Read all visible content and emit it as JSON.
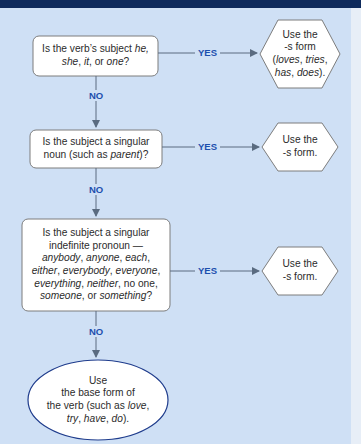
{
  "diagram": {
    "type": "flowchart",
    "colors": {
      "header_bar": "#0e2a5c",
      "background": "#cfe0f5",
      "box_fill": "#ffffff",
      "box_border": "#7a7a7a",
      "ellipse_border": "#1f3c8c",
      "connector": "#5a6b80",
      "label_text": "#1d4fae"
    },
    "decisions": [
      {
        "id": "q1",
        "lines": [
          "Is the verb's subject he,",
          "she, it, or one?"
        ],
        "italic_terms": [
          "he",
          "she",
          "it",
          "one"
        ],
        "yes_label": "YES",
        "no_label": "NO"
      },
      {
        "id": "q2",
        "lines": [
          "Is the subject a singular",
          "noun (such as parent)?"
        ],
        "italic_terms": [
          "parent"
        ],
        "yes_label": "YES",
        "no_label": "NO"
      },
      {
        "id": "q3",
        "lines": [
          "Is the subject a singular",
          "indefinite pronoun —",
          "anybody, anyone, each,",
          "either, everybody, everyone,",
          "everything, neither, no one,",
          "someone, or something?"
        ],
        "italic_terms": [
          "anybody",
          "anyone",
          "each",
          "either",
          "everybody",
          "everyone",
          "everything",
          "neither",
          "no one",
          "someone",
          "something"
        ],
        "yes_label": "YES",
        "no_label": "NO"
      }
    ],
    "outcomes": [
      {
        "id": "r1",
        "shape": "hexagon",
        "lines": [
          "Use the",
          "-s form",
          "(loves, tries,",
          "has, does)."
        ]
      },
      {
        "id": "r2",
        "shape": "hexagon",
        "lines": [
          "Use the",
          "-s form."
        ]
      },
      {
        "id": "r3",
        "shape": "hexagon",
        "lines": [
          "Use the",
          "-s form."
        ]
      },
      {
        "id": "r4",
        "shape": "ellipse",
        "lines": [
          "Use",
          "the base form of",
          "the verb (such as love,",
          "try, have, do)."
        ]
      }
    ]
  }
}
